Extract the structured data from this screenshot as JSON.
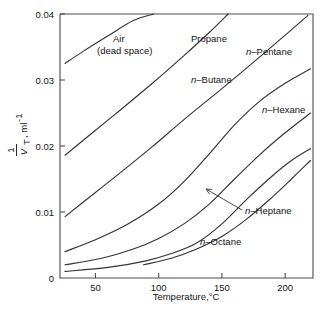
{
  "chart_data": {
    "type": "line",
    "title": "",
    "xlabel": "Temperature,°C",
    "ylabel": "1/V_T, ml⁻¹",
    "ylabel_numerator": "1",
    "ylabel_denominator": "V",
    "ylabel_denominator_sub": "T",
    "ylabel_units": ", ml",
    "ylabel_units_exp": "-1",
    "xlim": [
      22,
      222
    ],
    "ylim": [
      0,
      0.04
    ],
    "xticks": [
      50,
      100,
      150,
      200
    ],
    "xtick_labels": [
      "50",
      "100",
      "150",
      "200"
    ],
    "yticks": [
      0,
      0.01,
      0.02,
      0.03,
      0.04
    ],
    "ytick_labels": [
      "0",
      "0.01",
      "0.02",
      "0.03",
      "0.04"
    ],
    "grid": false,
    "legend": "inline-curve-labels",
    "series": [
      {
        "name": "Air (dead space)",
        "label_line1": "Air",
        "label_line2": "(dead space)",
        "label_italic_prefix": "",
        "label_x": 113,
        "label_y": 42,
        "label_y2": 54,
        "points": [
          [
            26,
            0.0325
          ],
          [
            40,
            0.0343
          ],
          [
            60,
            0.0367
          ],
          [
            80,
            0.039
          ],
          [
            96,
            0.04
          ]
        ]
      },
      {
        "name": "Propane",
        "label_line1": "Propane",
        "label_italic_prefix": "",
        "label_x": 191,
        "label_y": 42,
        "points": [
          [
            26,
            0.0186
          ],
          [
            45,
            0.0216
          ],
          [
            70,
            0.0255
          ],
          [
            95,
            0.0295
          ],
          [
            120,
            0.0337
          ],
          [
            140,
            0.0372
          ],
          [
            155,
            0.04
          ]
        ]
      },
      {
        "name": "n-Butane",
        "label_line1": "Butane",
        "label_italic_prefix": "n",
        "label_x": 191,
        "label_y": 83,
        "points": [
          [
            26,
            0.0093
          ],
          [
            45,
            0.0122
          ],
          [
            70,
            0.016
          ],
          [
            95,
            0.0199
          ],
          [
            120,
            0.024
          ],
          [
            150,
            0.0287
          ],
          [
            175,
            0.0327
          ],
          [
            200,
            0.0368
          ],
          [
            218,
            0.0398
          ]
        ]
      },
      {
        "name": "n-Pentane",
        "label_line1": "Pentane",
        "label_italic_prefix": "n",
        "label_x": 246,
        "label_y": 55,
        "points": [
          [
            26,
            0.004
          ],
          [
            50,
            0.0058
          ],
          [
            75,
            0.0081
          ],
          [
            100,
            0.0112
          ],
          [
            120,
            0.0146
          ],
          [
            140,
            0.0188
          ],
          [
            160,
            0.0232
          ],
          [
            180,
            0.0268
          ],
          [
            200,
            0.0295
          ],
          [
            220,
            0.0317
          ]
        ]
      },
      {
        "name": "n-Hexane",
        "label_line1": "Hexane",
        "label_italic_prefix": "n",
        "label_x": 262,
        "label_y": 113,
        "points": [
          [
            26,
            0.002
          ],
          [
            55,
            0.003
          ],
          [
            80,
            0.0044
          ],
          [
            100,
            0.006
          ],
          [
            120,
            0.0082
          ],
          [
            140,
            0.0112
          ],
          [
            160,
            0.015
          ],
          [
            180,
            0.0187
          ],
          [
            200,
            0.022
          ],
          [
            220,
            0.025
          ]
        ]
      },
      {
        "name": "n-Heptane",
        "label_line1": "Heptane",
        "label_italic_prefix": "n",
        "label_x": 245,
        "label_y": 214,
        "points": [
          [
            26,
            0.001
          ],
          [
            60,
            0.0016
          ],
          [
            90,
            0.0026
          ],
          [
            110,
            0.0037
          ],
          [
            130,
            0.0053
          ],
          [
            150,
            0.0082
          ],
          [
            170,
            0.012
          ],
          [
            190,
            0.0155
          ],
          [
            205,
            0.0178
          ],
          [
            220,
            0.0196
          ]
        ]
      },
      {
        "name": "n-Octane",
        "label_line1": "Octane",
        "label_italic_prefix": "n",
        "label_x": 200,
        "label_y": 245,
        "points": [
          [
            88,
            0.002
          ],
          [
            110,
            0.003
          ],
          [
            130,
            0.0044
          ],
          [
            150,
            0.0063
          ],
          [
            170,
            0.009
          ],
          [
            190,
            0.0123
          ],
          [
            205,
            0.015
          ],
          [
            220,
            0.0178
          ]
        ]
      }
    ],
    "annotations": [
      {
        "name": "heptane-arrow",
        "from_x": 242,
        "from_y": 210,
        "to_x": 206,
        "to_y": 189
      }
    ]
  }
}
